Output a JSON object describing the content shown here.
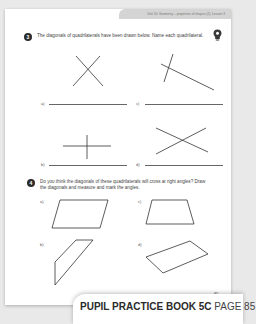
{
  "header": {
    "unit_text": "Unit 10: Geometry – properties of shapes (2), Lesson 3"
  },
  "question3": {
    "number": "3",
    "text": "The diagonals of quadrilaterals have been drawn below. Name each quadrilateral.",
    "parts": [
      {
        "label": "a)",
        "answer": ""
      },
      {
        "label": "b)",
        "answer": ""
      },
      {
        "label": "c)",
        "answer": ""
      },
      {
        "label": "d)",
        "answer": ""
      }
    ]
  },
  "question4": {
    "number": "4",
    "text": "Do you think the diagonals of these quadrilaterals will cross at right angles? Draw the diagonals and measure and mark the angles.",
    "parts": [
      {
        "label": "a)"
      },
      {
        "label": "b)"
      },
      {
        "label": "c)"
      },
      {
        "label": "d)"
      }
    ]
  },
  "page_number": "85",
  "footer_tab": {
    "book": "PUPIL PRACTICE BOOK 5C",
    "page": "PAGE 85"
  },
  "icons": {
    "hint": "lightbulb-hint-icon"
  }
}
